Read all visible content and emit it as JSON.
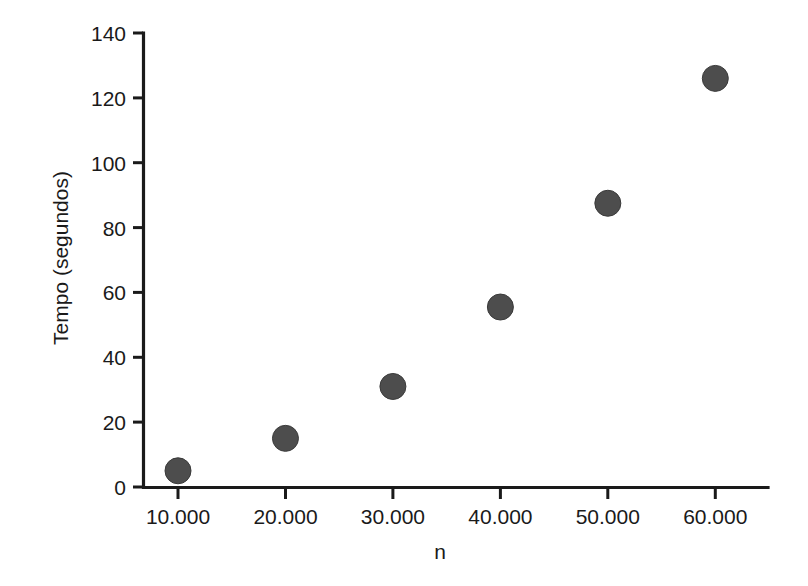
{
  "chart_data": {
    "type": "scatter",
    "title": "",
    "xlabel": "n",
    "ylabel": "Tempo (segundos)",
    "x": [
      10000,
      20000,
      30000,
      40000,
      50000,
      60000
    ],
    "values": [
      5,
      15,
      31,
      55.5,
      87.5,
      126
    ],
    "series": [
      {
        "name": "Tempo",
        "points": [
          {
            "x": 10000,
            "y": 5
          },
          {
            "x": 20000,
            "y": 15
          },
          {
            "x": 30000,
            "y": 31
          },
          {
            "x": 40000,
            "y": 55.5
          },
          {
            "x": 50000,
            "y": 87.5
          },
          {
            "x": 60000,
            "y": 126
          }
        ]
      }
    ],
    "xlim": [
      5000,
      65000
    ],
    "ylim": [
      0,
      140
    ],
    "x_tick_labels": [
      "10.000",
      "20.000",
      "30.000",
      "40.000",
      "50.000",
      "60.000"
    ],
    "x_tick_values": [
      10000,
      20000,
      30000,
      40000,
      50000,
      60000
    ],
    "y_tick_labels": [
      "0",
      "20",
      "40",
      "60",
      "80",
      "100",
      "120",
      "140"
    ],
    "y_tick_values": [
      0,
      20,
      40,
      60,
      80,
      100,
      120,
      140
    ],
    "grid": false,
    "legend": false,
    "legend_position": "none",
    "marker_color": "#4d4d4d",
    "axis_color": "#1a1a1a",
    "background_color": "#ffffff"
  },
  "axes": {
    "y_title": "Tempo (segundos)",
    "x_title": "n"
  },
  "y_ticks": [
    {
      "label": "0",
      "value": 0
    },
    {
      "label": "20",
      "value": 20
    },
    {
      "label": "40",
      "value": 40
    },
    {
      "label": "60",
      "value": 60
    },
    {
      "label": "80",
      "value": 80
    },
    {
      "label": "100",
      "value": 100
    },
    {
      "label": "120",
      "value": 120
    },
    {
      "label": "140",
      "value": 140
    }
  ],
  "x_ticks": [
    {
      "label": "10.000",
      "value": 10000
    },
    {
      "label": "20.000",
      "value": 20000
    },
    {
      "label": "30.000",
      "value": 30000
    },
    {
      "label": "40.000",
      "value": 40000
    },
    {
      "label": "50.000",
      "value": 50000
    },
    {
      "label": "60.000",
      "value": 60000
    }
  ]
}
